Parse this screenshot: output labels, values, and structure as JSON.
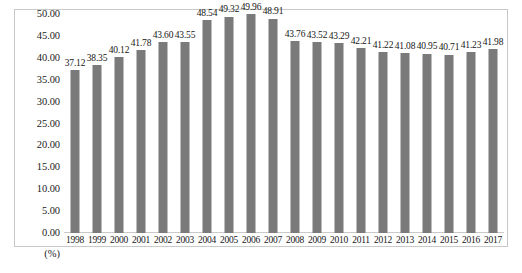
{
  "chart_data": {
    "type": "bar",
    "title": "",
    "xlabel": "",
    "ylabel": "(%)",
    "unit_label": "(%)",
    "ylim": [
      0,
      50
    ],
    "ytick_step": 5,
    "grid": false,
    "legend": null,
    "bar_color": "#7a7a7a",
    "frame_color": "#c9c9c9",
    "text_color": "#161616",
    "yticks": [
      "0.00",
      "5.00",
      "10.00",
      "15.00",
      "20.00",
      "25.00",
      "30.00",
      "35.00",
      "40.00",
      "45.00",
      "50.00"
    ],
    "categories": [
      "1998",
      "1999",
      "2000",
      "2001",
      "2002",
      "2003",
      "2004",
      "2005",
      "2006",
      "2007",
      "2008",
      "2009",
      "2010",
      "2011",
      "2012",
      "2013",
      "2014",
      "2015",
      "2016",
      "2017"
    ],
    "values": [
      37.12,
      38.35,
      40.12,
      41.78,
      43.6,
      43.55,
      48.54,
      49.32,
      49.96,
      48.91,
      43.76,
      43.52,
      43.29,
      42.21,
      41.22,
      41.08,
      40.95,
      40.71,
      41.23,
      41.98
    ],
    "value_labels": [
      "37.12",
      "38.35",
      "40.12",
      "41.78",
      "43.60",
      "43.55",
      "48.54",
      "49.32",
      "49.96",
      "48.91",
      "43.76",
      "43.52",
      "43.29",
      "42.21",
      "41.22",
      "41.08",
      "40.95",
      "40.71",
      "41.23",
      "41.98"
    ]
  }
}
